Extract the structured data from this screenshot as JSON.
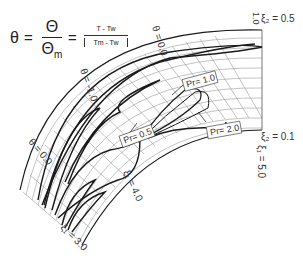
{
  "equation": {
    "lhs": "θ",
    "equals": "=",
    "frac1_num": "Θ",
    "frac1_den": "Θ",
    "frac1_den_sub": "m",
    "frac2_num": "T - Tw",
    "frac2_den": "Tm - Tw"
  },
  "grid": {
    "xi2_top_label": "ξ₂ = 0.5",
    "xi2_bottom_label": "ξ₂ = 0.1",
    "xi1_labels": [
      "ξ₁ = 3.0",
      "ξ₁ = 4.0",
      "ξ₁ = 5.0"
    ]
  },
  "contour_labels": {
    "theta_outer": "θ = 0.0",
    "theta_mid": "θ = -1.0",
    "theta_upper": "θ = 0.0",
    "theta_top": "1.0"
  },
  "callouts": {
    "pr_05": "Pr= 0.5",
    "pr_10": "Pr= 1.0",
    "pr_20": "Pr= 2.0"
  },
  "colors": {
    "grid": "#9a9a9a",
    "contour": "#1a1a1a",
    "text": "#333333"
  }
}
